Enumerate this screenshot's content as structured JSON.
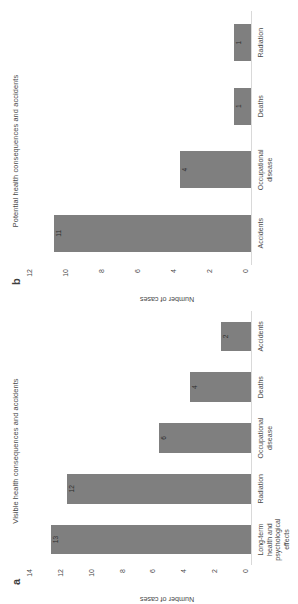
{
  "figure": {
    "orientation": "rotated-90-ccw",
    "bar_color": "#7f7f7f",
    "axis_color": "#d9d9d9",
    "text_color": "#4a4a4a"
  },
  "panels": [
    {
      "letter": "a",
      "title": "Visible health consequences and accidents"
    },
    {
      "letter": "b",
      "title": "Potential health consequences and accidents"
    }
  ],
  "chart_data": [
    {
      "type": "bar",
      "panel": "a",
      "title": "Visible health consequences and accidents",
      "xlabel": "",
      "ylabel": "Number of cases",
      "categories": [
        "Long-term health and psychological effects",
        "Radiation",
        "Occupational disease",
        "Deaths",
        "Accidents"
      ],
      "values": [
        13,
        12,
        6,
        4,
        2
      ],
      "ylim": [
        0,
        14
      ],
      "yticks": [
        0,
        2,
        4,
        6,
        8,
        10,
        12,
        14
      ],
      "grid": false,
      "legend": "none"
    },
    {
      "type": "bar",
      "panel": "b",
      "title": "Potential health consequences and accidents",
      "xlabel": "",
      "ylabel": "Number of cases",
      "categories": [
        "Accidents",
        "Occupational disease",
        "Deaths",
        "Radiation"
      ],
      "values": [
        11,
        4,
        1,
        1
      ],
      "ylim": [
        0,
        12
      ],
      "yticks": [
        0,
        2,
        4,
        6,
        8,
        10,
        12
      ],
      "grid": false,
      "legend": "none"
    }
  ]
}
